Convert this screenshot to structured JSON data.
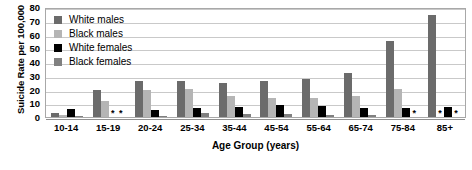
{
  "chart_data": {
    "type": "bar",
    "title": "",
    "xlabel": "Age Group (years)",
    "ylabel": "Suicide Rate per 100,000",
    "ylim": [
      0,
      80
    ],
    "ytick_labels": [
      "80",
      "70",
      "60",
      "50",
      "40",
      "30",
      "20",
      "10",
      "0"
    ],
    "ytick_values": [
      80,
      70,
      60,
      50,
      40,
      30,
      20,
      10,
      0
    ],
    "grid": true,
    "legend_position": "top-left",
    "suppressed_marker": "*",
    "categories": [
      "10-14",
      "15-19",
      "20-24",
      "25-34",
      "35-44",
      "45-54",
      "55-64",
      "65-74",
      "75-84",
      "85+"
    ],
    "series": [
      {
        "name": "White males",
        "color": "#6b6b6b",
        "values": [
          3,
          19.5,
          26,
          26,
          25,
          26,
          27.5,
          32,
          55,
          74.5
        ],
        "suppressed": [
          false,
          false,
          false,
          false,
          false,
          false,
          false,
          false,
          false,
          false
        ]
      },
      {
        "name": "Black males",
        "color": "#b5b5b5",
        "values": [
          1.5,
          11.5,
          20,
          20.5,
          15,
          14,
          14,
          15.5,
          20.5,
          null
        ],
        "suppressed": [
          false,
          false,
          false,
          false,
          false,
          false,
          false,
          false,
          false,
          true
        ]
      },
      {
        "name": "White females",
        "color": "#000000",
        "values": [
          5.5,
          null,
          5,
          6.5,
          7.5,
          8.5,
          8,
          6.5,
          6.5,
          7.5
        ],
        "suppressed": [
          false,
          true,
          false,
          false,
          false,
          false,
          false,
          false,
          false,
          false
        ]
      },
      {
        "name": "Black females",
        "color": "#808080",
        "values": [
          1,
          null,
          1,
          3,
          2.5,
          2.5,
          1.5,
          1.5,
          null,
          null
        ],
        "suppressed": [
          false,
          true,
          false,
          false,
          false,
          false,
          false,
          false,
          true,
          true
        ]
      }
    ]
  }
}
